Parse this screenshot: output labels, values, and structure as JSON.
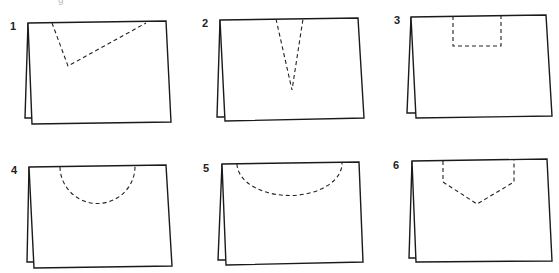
{
  "figure": {
    "partial_caption_glyph": "g",
    "panels": [
      {
        "number": "1",
        "cut_shape": "slanted-v-notch",
        "label_pos": [
          10,
          21
        ]
      },
      {
        "number": "2",
        "cut_shape": "narrow-v-notch",
        "label_pos": [
          202,
          18
        ]
      },
      {
        "number": "3",
        "cut_shape": "rectangle-notch",
        "label_pos": [
          394,
          15
        ]
      },
      {
        "number": "4",
        "cut_shape": "semicircle-notch",
        "label_pos": [
          11,
          165
        ]
      },
      {
        "number": "5",
        "cut_shape": "shallow-arc-notch",
        "label_pos": [
          203,
          163
        ]
      },
      {
        "number": "6",
        "cut_shape": "pentagon-notch",
        "label_pos": [
          393,
          160
        ]
      }
    ],
    "colors": {
      "line": "#1a1a1a",
      "dashed": "#222222",
      "background": "#ffffff"
    }
  }
}
